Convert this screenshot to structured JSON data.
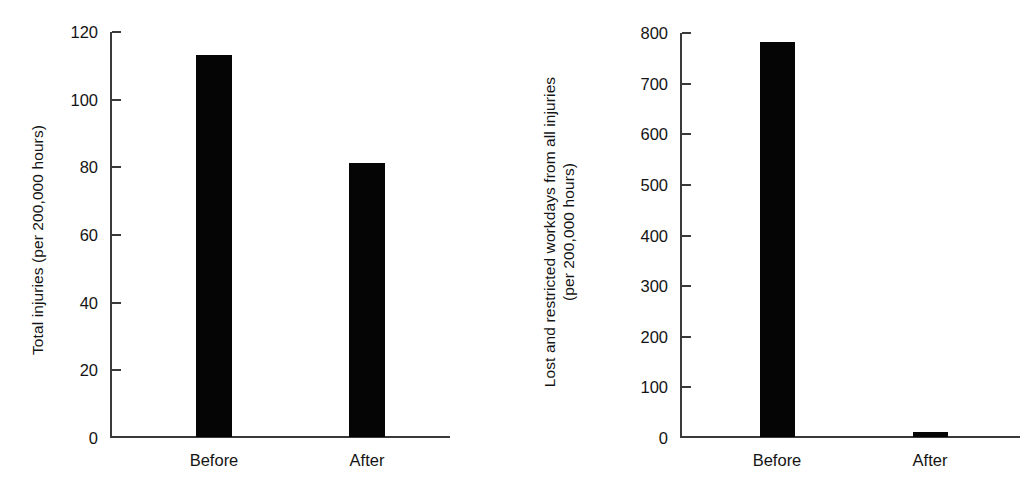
{
  "figure": {
    "background_color": "#ffffff",
    "bar_color": "#050505",
    "axis_color": "#3a3a3a",
    "text_color": "#141414"
  },
  "chart_data": [
    {
      "type": "bar",
      "panel": "left",
      "title": "",
      "subtitle": "",
      "xlabel": "",
      "ylabel": "Total injuries (per 200,000 hours)",
      "ylabel_lines": [
        "Total injuries (per 200,000 hours)"
      ],
      "categories": [
        "Before",
        "After"
      ],
      "values": [
        113,
        81
      ],
      "ylim": [
        0,
        120
      ],
      "yticks": [
        0,
        20,
        40,
        60,
        80,
        100,
        120
      ],
      "yticklabels": [
        "0",
        "20",
        "40",
        "60",
        "80",
        "100",
        "120"
      ],
      "grid": false,
      "legend": false,
      "legend_position": "none",
      "annotations": []
    },
    {
      "type": "bar",
      "panel": "right",
      "title": "",
      "subtitle": "",
      "xlabel": "",
      "ylabel": "Lost and restricted workdays from all injuries (per 200,000 hours)",
      "ylabel_lines": [
        "Lost and restricted workdays from all injuries",
        "(per 200,000 hours)"
      ],
      "categories": [
        "Before",
        "After"
      ],
      "values": [
        780,
        9
      ],
      "ylim": [
        0,
        800
      ],
      "yticks": [
        0,
        100,
        200,
        300,
        400,
        500,
        600,
        700,
        800
      ],
      "yticklabels": [
        "0",
        "100",
        "200",
        "300",
        "400",
        "500",
        "600",
        "700",
        "800"
      ],
      "grid": false,
      "legend": false,
      "legend_position": "none",
      "annotations": []
    }
  ]
}
